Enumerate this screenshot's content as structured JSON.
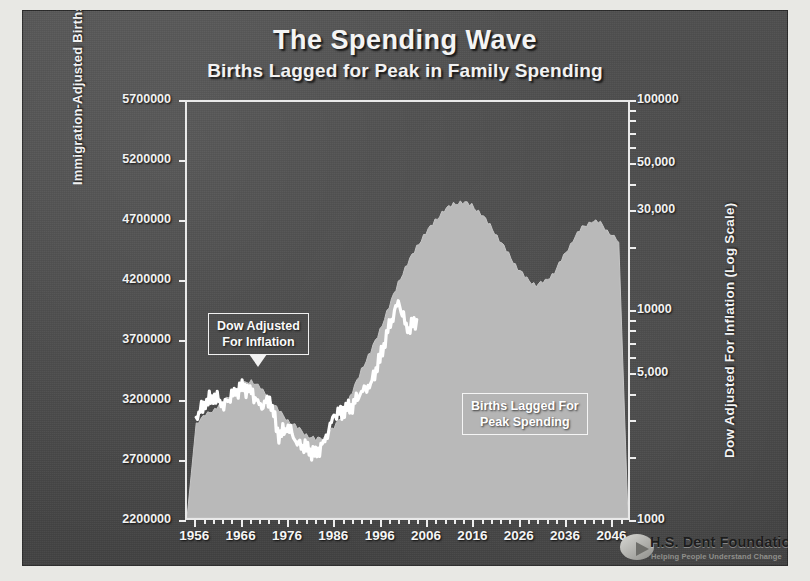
{
  "slide": {
    "title": "The Spending Wave",
    "subtitle": "Births Lagged for Peak in Family Spending",
    "background_color": "#4a4a4a",
    "text_color": "#f4f4f4"
  },
  "logo": {
    "name": "H.S. Dent Foundation",
    "tagline": "Helping People Understand Change"
  },
  "callouts": {
    "dow": "Dow Adjusted\nFor Inflation",
    "dow_line1": "Dow Adjusted",
    "dow_line2": "For Inflation",
    "births": "Births Lagged For\nPeak Spending",
    "births_line1": "Births Lagged For",
    "births_line2": "Peak Spending"
  },
  "chart_data": {
    "type": "area",
    "title": "The Spending Wave",
    "subtitle": "Births Lagged for Peak in Family Spending",
    "xlabel": "",
    "ylabel": "Immigration-Adjusted Births",
    "y2label": "Dow Adjusted For Inflation (Log Scale)",
    "grid": false,
    "legend_position": "none",
    "x": [
      1956,
      1958,
      1960,
      1962,
      1964,
      1966,
      1968,
      1970,
      1972,
      1974,
      1976,
      1978,
      1980,
      1982,
      1984,
      1986,
      1988,
      1990,
      1992,
      1994,
      1996,
      1998,
      2000,
      2002,
      2004,
      2006,
      2008,
      2010,
      2012,
      2014,
      2016,
      2018,
      2020,
      2022,
      2024,
      2026,
      2028,
      2030,
      2032,
      2034,
      2036,
      2038,
      2040,
      2042,
      2044,
      2046,
      2048
    ],
    "xticks": [
      1956,
      1966,
      1976,
      1986,
      1996,
      2006,
      2016,
      2026,
      2036,
      2046
    ],
    "xlim": [
      1954,
      2050
    ],
    "yticks_left": [
      2200000,
      2700000,
      3200000,
      3700000,
      4200000,
      4700000,
      5200000,
      5700000
    ],
    "ylim_left": [
      2200000,
      5700000
    ],
    "yticks_right": [
      "1000",
      "5,000",
      "10000",
      "30,000",
      "50,000",
      "100000"
    ],
    "yticks_right_values": [
      1000,
      5000,
      10000,
      30000,
      50000,
      100000
    ],
    "ylim_right": [
      1000,
      100000
    ],
    "yscale_right": "log",
    "series": [
      {
        "name": "Births Lagged For Peak Spending",
        "axis": "left",
        "type": "area",
        "color": "#b9b9b9",
        "values": [
          3000000,
          3060000,
          3120000,
          3180000,
          3250000,
          3320000,
          3360000,
          3290000,
          3200000,
          3100000,
          3020000,
          2960000,
          2900000,
          2860000,
          2880000,
          2960000,
          3080000,
          3260000,
          3450000,
          3600000,
          3780000,
          3980000,
          4180000,
          4340000,
          4480000,
          4600000,
          4700000,
          4790000,
          4840000,
          4860000,
          4830000,
          4760000,
          4660000,
          4540000,
          4420000,
          4300000,
          4210000,
          4160000,
          4190000,
          4270000,
          4400000,
          4540000,
          4640000,
          4700000,
          4680000,
          4600000,
          4520000
        ]
      },
      {
        "name": "Dow Adjusted For Inflation",
        "axis": "right",
        "type": "line",
        "color": "#ffffff",
        "values": [
          3050,
          3600,
          3850,
          3500,
          3900,
          4250,
          4050,
          3400,
          3750,
          2500,
          2750,
          2300,
          2150,
          2000,
          2350,
          3100,
          3300,
          3500,
          4050,
          4400,
          5800,
          8200,
          11000,
          8000,
          9000,
          null,
          null,
          null,
          null,
          null,
          null,
          null,
          null,
          null,
          null,
          null,
          null,
          null,
          null,
          null,
          null,
          null,
          null,
          null,
          null,
          null,
          null
        ]
      }
    ],
    "annotations": [
      {
        "text": "Dow Adjusted For Inflation",
        "x": 1972,
        "y_axis": "right"
      },
      {
        "text": "Births Lagged For Peak Spending",
        "x": 2020,
        "y_axis": "left"
      }
    ]
  },
  "axes": {
    "left_title": "Immigration-Adjusted Births",
    "right_title": "Dow Adjusted For Inflation (Log Scale)"
  }
}
